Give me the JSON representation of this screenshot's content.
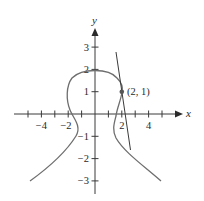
{
  "figure": {
    "type": "implicit curve with tangent line",
    "axes": {
      "x_label": "x",
      "y_label": "y",
      "x_ticks": [
        -5,
        -4,
        -3,
        -2,
        -1,
        1,
        2,
        3,
        4,
        5
      ],
      "x_tick_labels": [
        {
          "value": -4,
          "text": "−4"
        },
        {
          "value": -2,
          "text": "−2"
        },
        {
          "value": 2,
          "text": "2"
        },
        {
          "value": 4,
          "text": "4"
        }
      ],
      "y_ticks": [
        -3,
        -2,
        -1,
        1,
        2,
        3
      ],
      "y_tick_labels": [
        {
          "value": 3,
          "text": "3"
        },
        {
          "value": 2,
          "text": "2"
        },
        {
          "value": 1,
          "text": "1"
        },
        {
          "value": -1,
          "text": "−1"
        },
        {
          "value": -2,
          "text": "−2"
        },
        {
          "value": -3,
          "text": "−3"
        }
      ],
      "x_range": [
        -5.3,
        5.8
      ],
      "y_range": [
        -3.6,
        3.8
      ]
    },
    "point": {
      "x": 2,
      "y": 1,
      "label": "(2, 1)"
    },
    "tangent_line": {
      "from": [
        1.6,
        2.8
      ],
      "to": [
        2.65,
        -1.6
      ]
    },
    "colors": {
      "curve": "#6e6e6e",
      "axes": "#3a3a3a",
      "text": "#2a2a2a",
      "point": "#555555"
    }
  }
}
